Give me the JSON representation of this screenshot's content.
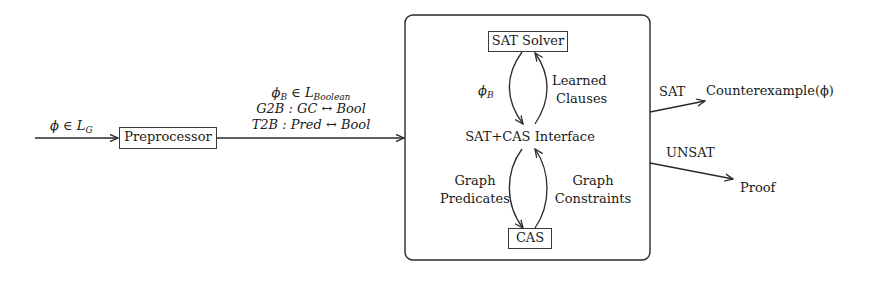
{
  "diagram": {
    "input_label": "ϕ ∈ L",
    "input_label_sub": "G",
    "preprocessor": "Preprocessor",
    "mapping_lines": {
      "line1_main": "ϕ",
      "line1_sub": "B",
      "line1_rest": " ∈ L",
      "line1_rest_sub": "Boolean",
      "line2": "G2B : GC ↔ Bool",
      "line3": "T2B : Pred ↔ Bool"
    },
    "sat_solver": "SAT Solver",
    "phi_b": "ϕ",
    "phi_b_sub": "B",
    "learned_clauses": [
      "Learned",
      "Clauses"
    ],
    "interface": "SAT+CAS Interface",
    "graph_predicates": [
      "Graph",
      "Predicates"
    ],
    "graph_constraints": [
      "Graph",
      "Constraints"
    ],
    "cas": "CAS",
    "sat_label": "SAT",
    "counterexample": "Counterexample(ϕ)",
    "unsat_label": "UNSAT",
    "proof": "Proof"
  },
  "colors": {
    "stroke": "#2a2a2a",
    "background": "#ffffff"
  }
}
